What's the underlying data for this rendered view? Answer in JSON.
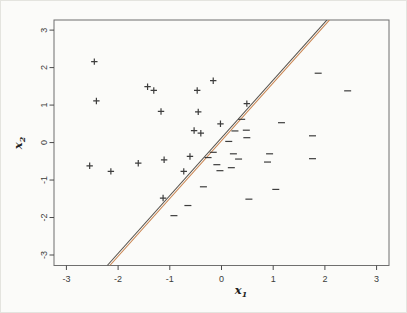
{
  "figure": {
    "background": "#fbfbf9",
    "frame_color": "#e4e4df"
  },
  "chart_data": {
    "type": "scatter",
    "title": "",
    "xlabel": {
      "base": "x",
      "sub": "1"
    },
    "ylabel": {
      "base": "x",
      "sub": "2"
    },
    "x_ticks": [
      -3,
      -2,
      -1,
      0,
      1,
      2,
      3
    ],
    "y_ticks": [
      -3,
      -2,
      -1,
      0,
      1,
      2,
      3
    ],
    "xlim": [
      -3.24,
      3.24
    ],
    "ylim": [
      -3.28,
      3.27
    ],
    "grid": false,
    "legend": null,
    "box_color": "#6f6f6f",
    "tick_color": "#4a4a4a",
    "tick_label_color": "#3b3b3b",
    "marker_color": "#3d3d3d",
    "series": [
      {
        "name": "positive-class",
        "marker": "plus",
        "points": [
          [
            -2.46,
            2.16
          ],
          [
            -2.42,
            1.11
          ],
          [
            -1.43,
            1.49
          ],
          [
            -1.31,
            1.39
          ],
          [
            -0.47,
            1.39
          ],
          [
            -0.16,
            1.65
          ],
          [
            0.49,
            1.04
          ],
          [
            -1.17,
            0.83
          ],
          [
            -0.45,
            0.82
          ],
          [
            -0.02,
            0.5
          ],
          [
            -0.53,
            0.32
          ],
          [
            -0.4,
            0.25
          ],
          [
            -2.55,
            -0.62
          ],
          [
            -2.14,
            -0.77
          ],
          [
            -1.61,
            -0.55
          ],
          [
            -1.11,
            -0.46
          ],
          [
            -0.61,
            -0.37
          ],
          [
            -0.73,
            -0.77
          ],
          [
            -1.13,
            -1.48
          ]
        ]
      },
      {
        "name": "negative-class",
        "marker": "minus",
        "points": [
          [
            1.87,
            1.85
          ],
          [
            2.44,
            1.38
          ],
          [
            0.39,
            0.62
          ],
          [
            1.16,
            0.53
          ],
          [
            0.26,
            0.31
          ],
          [
            0.48,
            0.33
          ],
          [
            0.49,
            0.13
          ],
          [
            0.14,
            0.03
          ],
          [
            1.76,
            0.18
          ],
          [
            -0.16,
            -0.26
          ],
          [
            -0.26,
            -0.4
          ],
          [
            0.23,
            -0.3
          ],
          [
            0.33,
            -0.44
          ],
          [
            -0.09,
            -0.59
          ],
          [
            0.19,
            -0.67
          ],
          [
            -0.03,
            -0.75
          ],
          [
            0.93,
            -0.3
          ],
          [
            0.89,
            -0.52
          ],
          [
            1.76,
            -0.43
          ],
          [
            -0.35,
            -1.18
          ],
          [
            1.05,
            -1.25
          ],
          [
            0.53,
            -1.51
          ],
          [
            -0.65,
            -1.68
          ],
          [
            -0.92,
            -1.95
          ]
        ]
      }
    ],
    "lines": [
      {
        "name": "black-decision-boundary",
        "color": "#55504a",
        "width": 1.1,
        "from": [
          -2.21,
          -3.28
        ],
        "to": [
          2.04,
          3.27
        ]
      },
      {
        "name": "orange-decision-boundary",
        "color": "#c8824e",
        "width": 1.1,
        "from": [
          -2.16,
          -3.28
        ],
        "to": [
          2.09,
          3.27
        ]
      }
    ]
  }
}
